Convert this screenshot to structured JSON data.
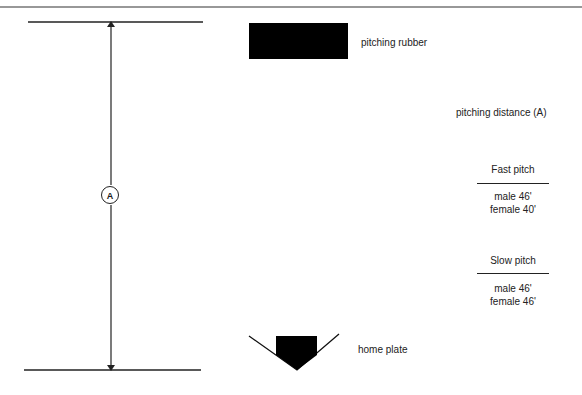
{
  "diagram": {
    "labels": {
      "pitching_rubber": "pitching rubber",
      "home_plate": "home plate",
      "pitching_distance": "pitching distance (A)",
      "dimension_marker": "A"
    },
    "tables": [
      {
        "heading": "Fast pitch",
        "rows": [
          "male 46'",
          "female 40'"
        ]
      },
      {
        "heading": "Slow pitch",
        "rows": [
          "male 46'",
          "female 46'"
        ]
      }
    ],
    "colors": {
      "ink": "#1a1a1a",
      "background": "#ffffff"
    }
  }
}
